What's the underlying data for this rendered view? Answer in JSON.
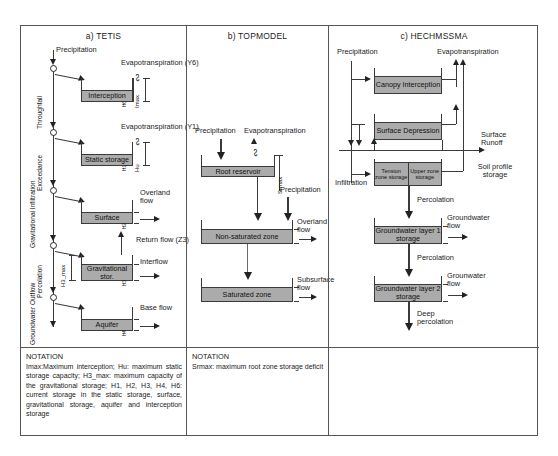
{
  "figure": {
    "panels": [
      {
        "id": "a",
        "title": "a) TETIS",
        "flux_labels": {
          "precipitation": "Precipitation",
          "throughfall": "Throughfall",
          "exceedance": "Exceedance",
          "gravitational_infiltration": "Gravitational Infiltration",
          "percolation": "Percolation",
          "groundwater_outflow": "Groundwater Outflow",
          "evapotranspiration_y6": "Evapotranspiration (Y6)",
          "evapotranspiration_y1": "Evapotranspiration (Y1)",
          "overland_flow": "Overland flow",
          "return_flow": "Return flow (Z3)",
          "interflow": "Interflow",
          "base_flow": "Base flow"
        },
        "tanks": [
          {
            "name": "Interception",
            "state": "H6",
            "capacity": "Imax"
          },
          {
            "name": "Static storage",
            "state": "H1",
            "capacity": "Hu"
          },
          {
            "name": "Surface",
            "state": "H2",
            "capacity": ""
          },
          {
            "name": "Gravitational stor.",
            "state": "H3",
            "capacity": "H3_max"
          },
          {
            "name": "Aquifer",
            "state": "H4",
            "capacity": ""
          }
        ],
        "notation": {
          "title": "NOTATION",
          "body": "Imax:Maximum interception; Hu: maximum static storage capacity; H3_max: maximum capacity of the gravitational storage; H1, H2, H3, H4, H6: current storage in the static storage, surface, gravitational storage, aquifer and interception storage"
        }
      },
      {
        "id": "b",
        "title": "b) TOPMODEL",
        "flux_labels": {
          "precipitation": "Precipitation",
          "evapotranspiration": "Evapotranspiration",
          "precipitation_2": "Precipitation",
          "overland_flow": "Overland flow",
          "subsurface_flow": "Subsurface flow",
          "srmax": "Srmax"
        },
        "tanks": [
          {
            "name": "Root reservoir"
          },
          {
            "name": "Non-saturated zone"
          },
          {
            "name": "Saturated zone"
          }
        ],
        "notation": {
          "title": "NOTATION",
          "body": "Srmax: maximum root zone storage deficit"
        }
      },
      {
        "id": "c",
        "title": "c) HECHMSSMA",
        "flux_labels": {
          "precipitation": "Precipitation",
          "evapotranspiration": "Evapotranspiration",
          "surface_runoff": "Surface Runoff",
          "infiltration": "Infiltration",
          "soil_profile_storage": "Soil profile storage",
          "percolation_1": "Percolation",
          "percolation_2": "Percolation",
          "groundwater_flow_1": "Groundwater flow",
          "groundwater_flow_2": "Grounwater flow",
          "deep_percolation": "Deep percolation"
        },
        "tanks": [
          {
            "name": "Canopy Interception"
          },
          {
            "name": "Surface Depression"
          },
          {
            "name": "Tension zone storage",
            "name2": "Upper zone storage"
          },
          {
            "name": "Groundwater layer 1 storage"
          },
          {
            "name": "Groundwater layer 2 storage"
          }
        ]
      }
    ]
  },
  "colors": {
    "tank_fill": "#ababab",
    "stroke": "#3a3a3a",
    "frame": "#555555",
    "text": "#1b1b1b"
  }
}
